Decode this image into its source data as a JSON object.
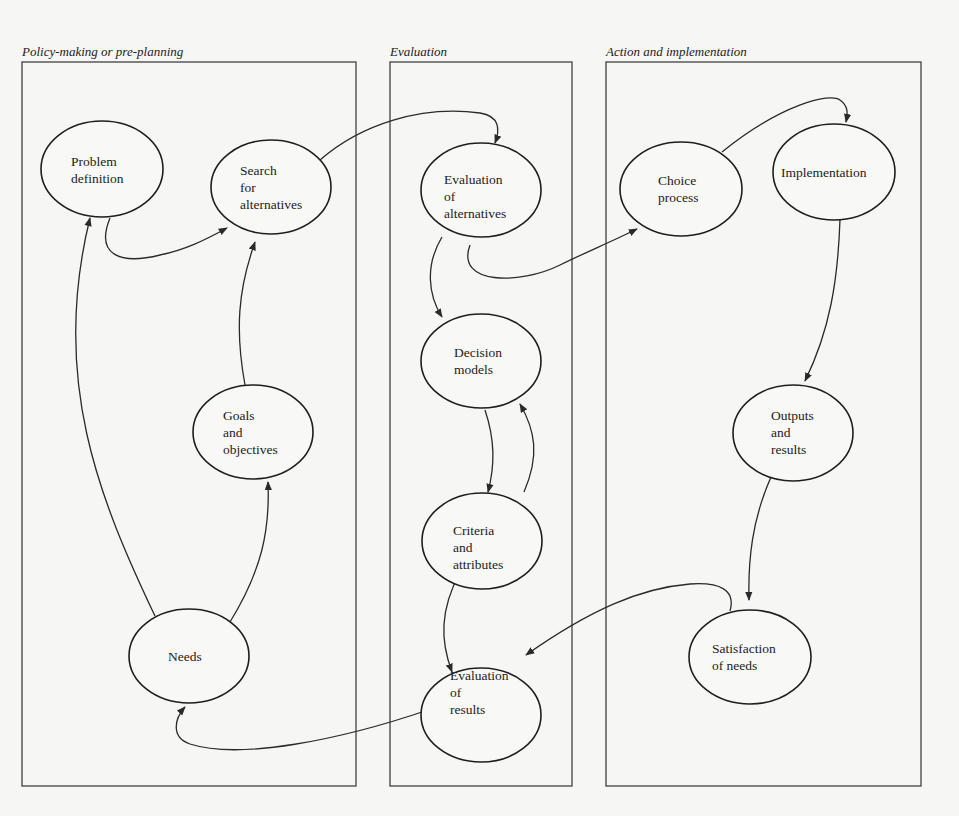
{
  "phases": [
    {
      "id": "policy",
      "title": "Policy-making or pre-planning"
    },
    {
      "id": "evaluation",
      "title": "Evaluation"
    },
    {
      "id": "action",
      "title": "Action and implementation"
    }
  ],
  "nodes": [
    {
      "id": "problem-definition",
      "phase": "policy",
      "lines": [
        "Problem",
        "definition"
      ]
    },
    {
      "id": "search-alternatives",
      "phase": "policy",
      "lines": [
        "Search",
        "for",
        "alternatives"
      ]
    },
    {
      "id": "goals-objectives",
      "phase": "policy",
      "lines": [
        "Goals",
        "and",
        "objectives"
      ]
    },
    {
      "id": "needs",
      "phase": "policy",
      "lines": [
        "Needs"
      ]
    },
    {
      "id": "evaluation-alternatives",
      "phase": "evaluation",
      "lines": [
        "Evaluation",
        "of",
        "alternatives"
      ]
    },
    {
      "id": "decision-models",
      "phase": "evaluation",
      "lines": [
        "Decision",
        "models"
      ]
    },
    {
      "id": "criteria-attributes",
      "phase": "evaluation",
      "lines": [
        "Criteria",
        "and",
        "attributes"
      ]
    },
    {
      "id": "evaluation-results",
      "phase": "evaluation",
      "lines": [
        "Evaluation",
        "of",
        "results"
      ]
    },
    {
      "id": "choice-process",
      "phase": "action",
      "lines": [
        "Choice",
        "process"
      ]
    },
    {
      "id": "implementation",
      "phase": "action",
      "lines": [
        "Implementation"
      ]
    },
    {
      "id": "outputs-results",
      "phase": "action",
      "lines": [
        "Outputs",
        "and",
        "results"
      ]
    },
    {
      "id": "satisfaction-needs",
      "phase": "action",
      "lines": [
        "Satisfaction",
        "of needs"
      ]
    }
  ],
  "edges": [
    {
      "from": "needs",
      "to": "problem-definition"
    },
    {
      "from": "needs",
      "to": "goals-objectives"
    },
    {
      "from": "goals-objectives",
      "to": "search-alternatives"
    },
    {
      "from": "problem-definition",
      "to": "search-alternatives"
    },
    {
      "from": "search-alternatives",
      "to": "evaluation-alternatives"
    },
    {
      "from": "evaluation-alternatives",
      "to": "decision-models"
    },
    {
      "from": "evaluation-alternatives",
      "to": "choice-process"
    },
    {
      "from": "decision-models",
      "to": "criteria-attributes"
    },
    {
      "from": "criteria-attributes",
      "to": "decision-models"
    },
    {
      "from": "criteria-attributes",
      "to": "evaluation-results"
    },
    {
      "from": "choice-process",
      "to": "implementation"
    },
    {
      "from": "implementation",
      "to": "outputs-results"
    },
    {
      "from": "outputs-results",
      "to": "satisfaction-needs"
    },
    {
      "from": "satisfaction-needs",
      "to": "evaluation-results"
    },
    {
      "from": "evaluation-results",
      "to": "needs"
    }
  ],
  "colors": {
    "stroke": "#2a2a2a",
    "background": "#f6f6f4"
  }
}
